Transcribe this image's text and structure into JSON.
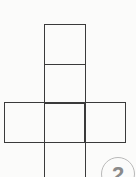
{
  "figure": {
    "type": "cube-net",
    "line_color": "#3a3a3a",
    "cells": [
      {
        "name": "top",
        "x": 44,
        "y": 24,
        "w": 42,
        "h": 41
      },
      {
        "name": "upper-middle",
        "x": 44,
        "y": 64,
        "w": 42,
        "h": 39
      },
      {
        "name": "left",
        "x": 4,
        "y": 102,
        "w": 41,
        "h": 41
      },
      {
        "name": "center",
        "x": 44,
        "y": 102,
        "w": 42,
        "h": 41
      },
      {
        "name": "right",
        "x": 84,
        "y": 102,
        "w": 42,
        "h": 41
      },
      {
        "name": "bottom",
        "x": 44,
        "y": 142,
        "w": 42,
        "h": 40
      }
    ]
  },
  "badge": {
    "label": "2",
    "color": "#8a8a8a"
  }
}
